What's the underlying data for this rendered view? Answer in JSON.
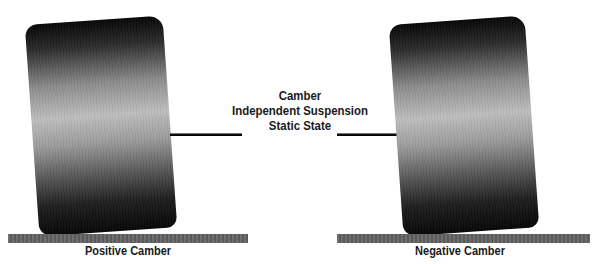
{
  "diagram": {
    "title_lines": [
      "Camber",
      "Independent Suspension",
      "Static State"
    ],
    "left": {
      "label": "Positive Camber",
      "tire_tilt_deg": 4
    },
    "right": {
      "label": "Negative Camber",
      "tire_tilt_deg": 4
    },
    "colors": {
      "background": "#ffffff",
      "tire_dark": "#050505",
      "tire_light": "#bdbdbd",
      "ground": "#646464",
      "axle": "#000000",
      "text": "#1a1a1a"
    }
  }
}
